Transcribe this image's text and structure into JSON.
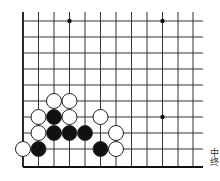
{
  "board": {
    "grid": {
      "x_lines": [
        23,
        38.5,
        54,
        69.5,
        85,
        100.5,
        116,
        131.5,
        147,
        162.5,
        178,
        193
      ],
      "y_lines": [
        21,
        37,
        53,
        69,
        85,
        101,
        117,
        133,
        149,
        167
      ],
      "right_extent": 203,
      "top_extent": 12,
      "line_color": "#333333",
      "edge_color": "#111111"
    },
    "star_points": [
      {
        "x": 69.5,
        "y": 21
      },
      {
        "x": 162.5,
        "y": 21
      },
      {
        "x": 162.5,
        "y": 117
      }
    ],
    "stones": [
      {
        "color": "white",
        "x": 54,
        "y": 101
      },
      {
        "color": "white",
        "x": 69.5,
        "y": 101
      },
      {
        "color": "white",
        "x": 38.5,
        "y": 117
      },
      {
        "color": "black",
        "x": 54,
        "y": 117
      },
      {
        "color": "white",
        "x": 69.5,
        "y": 117
      },
      {
        "color": "white",
        "x": 100.5,
        "y": 117
      },
      {
        "color": "white",
        "x": 38.5,
        "y": 133
      },
      {
        "color": "black",
        "x": 54,
        "y": 133
      },
      {
        "color": "black",
        "x": 69.5,
        "y": 133
      },
      {
        "color": "black",
        "x": 85,
        "y": 133
      },
      {
        "color": "white",
        "x": 116,
        "y": 133
      },
      {
        "color": "white",
        "x": 23,
        "y": 149
      },
      {
        "color": "black",
        "x": 38.5,
        "y": 149
      },
      {
        "color": "black",
        "x": 100.5,
        "y": 149
      },
      {
        "color": "white",
        "x": 116,
        "y": 149
      }
    ],
    "stone_radius": 7.5
  },
  "caption": {
    "text": "中终"
  }
}
